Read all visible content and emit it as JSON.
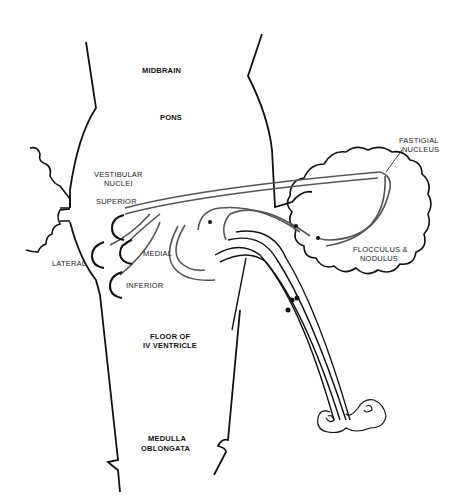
{
  "diagram": {
    "regions": {
      "midbrain": "MIDBRAIN",
      "pons": "PONS",
      "floor_line1": "FLOOR OF",
      "floor_line2": "IV VENTRICLE",
      "medulla_line1": "MEDULLA",
      "medulla_line2": "OBLONGATA"
    },
    "nuclei": {
      "group_line1": "VESTIBULAR",
      "group_line2": "NUCLEI",
      "superior": "SUPERIOR",
      "lateral": "LATERAL",
      "medial": "MEDIAL",
      "inferior": "INFERIOR"
    },
    "cerebellum": {
      "fastigial_line1": "FASTIGIAL",
      "fastigial_line2": "NUCLEUS",
      "flocculus_line1": "FLOCCULUS &",
      "flocculus_line2": "NODULUS"
    },
    "colors": {
      "outline": "#111111",
      "pathway": "#555555",
      "label": "#222222"
    }
  }
}
